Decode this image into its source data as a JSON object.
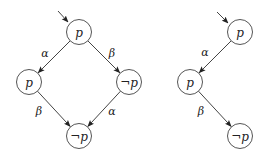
{
  "diagrams": [
    {
      "name": "left-diagram",
      "initial_arrow": {
        "from": [
          58,
          11
        ],
        "to": [
          68,
          22
        ]
      },
      "nodes": [
        {
          "id": "n0",
          "label": "p",
          "x": 79,
          "y": 32
        },
        {
          "id": "n1",
          "label": "p",
          "x": 29,
          "y": 82
        },
        {
          "id": "n2",
          "label": "¬p",
          "x": 129,
          "y": 82
        },
        {
          "id": "n3",
          "label": "¬p",
          "x": 79,
          "y": 136
        }
      ],
      "edges": [
        {
          "from": "n0",
          "to": "n1",
          "label": "α",
          "lx": 45,
          "ly": 54
        },
        {
          "from": "n0",
          "to": "n2",
          "label": "β",
          "lx": 112,
          "ly": 54
        },
        {
          "from": "n1",
          "to": "n3",
          "label": "β",
          "lx": 39,
          "ly": 112
        },
        {
          "from": "n2",
          "to": "n3",
          "label": "α",
          "lx": 112,
          "ly": 112
        }
      ]
    },
    {
      "name": "right-diagram",
      "initial_arrow": {
        "from": [
          217,
          12
        ],
        "to": [
          228,
          23
        ]
      },
      "nodes": [
        {
          "id": "m0",
          "label": "p",
          "x": 240,
          "y": 32
        },
        {
          "id": "m1",
          "label": "p",
          "x": 190,
          "y": 82
        },
        {
          "id": "m2",
          "label": "¬p",
          "x": 240,
          "y": 136
        }
      ],
      "edges": [
        {
          "from": "m0",
          "to": "m1",
          "label": "α",
          "lx": 205,
          "ly": 53
        },
        {
          "from": "m1",
          "to": "m2",
          "label": "β",
          "lx": 201,
          "ly": 112
        }
      ]
    }
  ],
  "node_radius": 12.5
}
